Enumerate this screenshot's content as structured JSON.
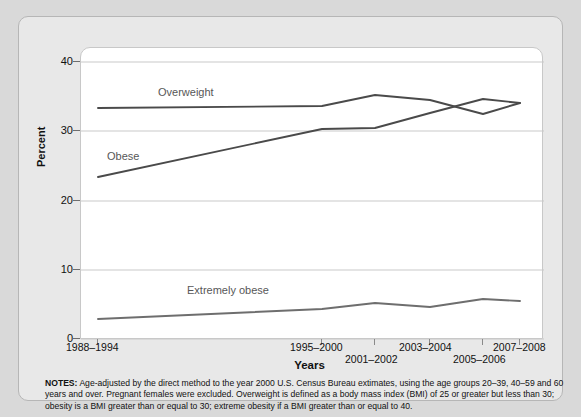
{
  "chart_data": {
    "type": "line",
    "title": "",
    "xlabel": "Years",
    "ylabel": "Percent",
    "ylim": [
      0,
      40
    ],
    "yticks": [
      0,
      10,
      20,
      30,
      40
    ],
    "grid": true,
    "legend_position": "inline-labels",
    "categories": [
      "1988–1994",
      "1995–2000",
      "2001–2002",
      "2003–2004",
      "2005–2006",
      "2007–2008"
    ],
    "x": [
      0,
      0.78,
      0.97,
      1.17,
      1.36,
      1.55
    ],
    "series": [
      {
        "name": "Overweight",
        "color": "#4a4a4a",
        "values": [
          33.3,
          33.7,
          34.7,
          34.4,
          32.5,
          34.0
        ],
        "points_px": [
          {
            "x": 78,
            "y": 90
          },
          {
            "x": 302,
            "y": 88
          },
          {
            "x": 355,
            "y": 77
          },
          {
            "x": 410,
            "y": 82
          },
          {
            "x": 463,
            "y": 96
          },
          {
            "x": 500,
            "y": 85
          }
        ]
      },
      {
        "name": "Obese",
        "color": "#4a4a4a",
        "values": [
          22.9,
          30.5,
          30.6,
          32.2,
          34.3,
          34.0
        ],
        "points_px": [
          {
            "x": 78,
            "y": 159
          },
          {
            "x": 302,
            "y": 111
          },
          {
            "x": 355,
            "y": 110
          },
          {
            "x": 410,
            "y": 95
          },
          {
            "x": 463,
            "y": 81
          },
          {
            "x": 500,
            "y": 85
          }
        ]
      },
      {
        "name": "Extremely obese",
        "color": "#6e6e6e",
        "values": [
          2.9,
          4.7,
          5.3,
          4.9,
          5.9,
          5.7
        ],
        "points_px": [
          {
            "x": 78,
            "y": 301
          },
          {
            "x": 302,
            "y": 291
          },
          {
            "x": 355,
            "y": 285
          },
          {
            "x": 410,
            "y": 289
          },
          {
            "x": 463,
            "y": 281
          },
          {
            "x": 500,
            "y": 283
          }
        ]
      }
    ],
    "series_inline_labels": [
      {
        "text": "Overweight",
        "left": 139,
        "top": 69
      },
      {
        "text": "Obese",
        "left": 88,
        "top": 133
      },
      {
        "text": "Extremely obese",
        "left": 168,
        "top": 267
      }
    ]
  },
  "axes": {
    "y_tick_labels": [
      "40",
      "30",
      "20",
      "10",
      "0"
    ],
    "y_tick_tops": [
      39,
      108,
      178,
      247,
      316
    ],
    "y_axis_title": "Percent",
    "x_axis_title": "Years",
    "x_tick_labels": [
      {
        "text": "1988–1994",
        "left": 47,
        "top": 325,
        "row": 0
      },
      {
        "text": "1995–2000",
        "left": 271,
        "top": 325,
        "row": 0
      },
      {
        "text": "2001–2002",
        "left": 326,
        "top": 337,
        "row": 1
      },
      {
        "text": "2003–2004",
        "left": 380,
        "top": 325,
        "row": 0
      },
      {
        "text": "2005–2006",
        "left": 434,
        "top": 337,
        "row": 1
      },
      {
        "text": "2007–2008",
        "left": 474,
        "top": 325,
        "row": 0
      }
    ],
    "x_tick_marks_px": [
      78,
      302,
      355,
      410,
      463,
      500
    ]
  },
  "notes": {
    "label": "NOTES:",
    "text": " Age-adjusted by the direct method to the year 2000 U.S. Census Bureau extimates, using the age groups 20–39, 40–59 and 60 years and over. Pregnant females were excluded. Overweight is defined as a body mass index (BMI) of 25 or greater but less than 30; obesity is a BMI greater than or equal to 30; extreme obesity if a BMI greater than or equal to 40."
  },
  "colors": {
    "page_background": "#d9d9d9",
    "card_background": "#e8e8e8",
    "plot_background": "#ffffff",
    "gridline": "#c9c9c9",
    "line_dark": "#4a4a4a",
    "line_gray": "#6e6e6e",
    "text": "#111111"
  }
}
